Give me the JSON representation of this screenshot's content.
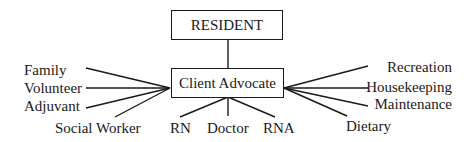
{
  "diagram": {
    "top_node": "RESIDENT",
    "center_node": "Client Advocate",
    "left_nodes": [
      "Family",
      "Volunteer",
      "Adjuvant",
      "Social Worker"
    ],
    "bottom_nodes": [
      "RN",
      "Doctor",
      "RNA"
    ],
    "right_nodes": [
      "Recreation",
      "Housekeeping",
      "Maintenance",
      "Dietary"
    ]
  }
}
